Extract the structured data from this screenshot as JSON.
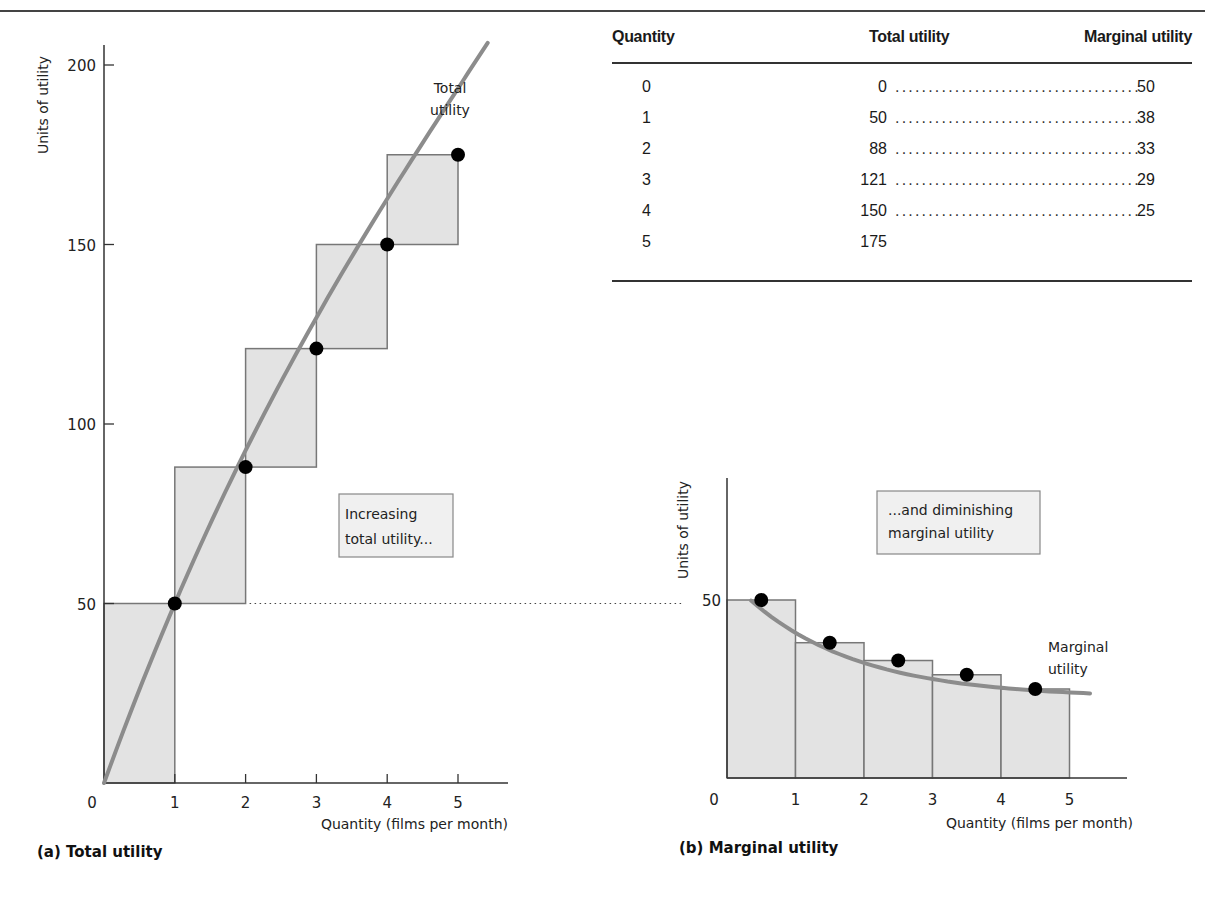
{
  "captions": {
    "left": "(a) Total utility",
    "right": "(b) Marginal utility"
  },
  "table": {
    "headers": [
      "Quantity",
      "Total utility",
      "Marginal utility"
    ],
    "rows": [
      {
        "quantity": "0",
        "total": "0",
        "marginal": "50"
      },
      {
        "quantity": "1",
        "total": "50",
        "marginal": "38"
      },
      {
        "quantity": "2",
        "total": "88",
        "marginal": "33"
      },
      {
        "quantity": "3",
        "total": "121",
        "marginal": "29"
      },
      {
        "quantity": "4",
        "total": "150",
        "marginal": "25"
      },
      {
        "quantity": "5",
        "total": "175",
        "marginal": ""
      }
    ]
  },
  "colors": {
    "bar_fill": "#e3e3e3",
    "bar_stroke": "#777777",
    "curve": "#8c8c8c",
    "point": "#000000",
    "axis": "#333333"
  },
  "chart_data": [
    {
      "type": "bar",
      "title": "(a) Total utility",
      "xlabel": "Quantity (films per month)",
      "ylabel": "Units of utility",
      "x": [
        1,
        2,
        3,
        4,
        5
      ],
      "xticks": [
        "0",
        "1",
        "2",
        "3",
        "4",
        "5"
      ],
      "yticks": [
        "50",
        "100",
        "150",
        "200"
      ],
      "ylim": [
        0,
        200
      ],
      "xlim": [
        0,
        5.5
      ],
      "series": [
        {
          "name": "Total utility",
          "values": [
            50,
            88,
            121,
            150,
            175
          ]
        }
      ],
      "step_boxes": [
        {
          "x0": 0,
          "x1": 1,
          "y0": 0,
          "y1": 50
        },
        {
          "x0": 1,
          "x1": 2,
          "y0": 50,
          "y1": 88
        },
        {
          "x0": 2,
          "x1": 3,
          "y0": 88,
          "y1": 121
        },
        {
          "x0": 3,
          "x1": 4,
          "y0": 121,
          "y1": 150
        },
        {
          "x0": 4,
          "x1": 5,
          "y0": 150,
          "y1": 175
        }
      ],
      "curve_label": "Total utility",
      "annotation": "Increasing total utility...",
      "grid": false
    },
    {
      "type": "bar",
      "title": "(b) Marginal utility",
      "xlabel": "Quantity (films per month)",
      "ylabel": "Units of utility",
      "categories": [
        "0-1",
        "1-2",
        "2-3",
        "3-4",
        "4-5"
      ],
      "xticks": [
        "0",
        "1",
        "2",
        "3",
        "4",
        "5"
      ],
      "yticks": [
        "50"
      ],
      "values": [
        50,
        38,
        33,
        29,
        25
      ],
      "points_x": [
        0.5,
        1.5,
        2.5,
        3.5,
        4.5
      ],
      "ylim": [
        0,
        75
      ],
      "xlim": [
        0,
        5.8
      ],
      "curve_label": "Marginal utility",
      "annotation": "...and diminishing marginal utility",
      "grid": false
    }
  ]
}
